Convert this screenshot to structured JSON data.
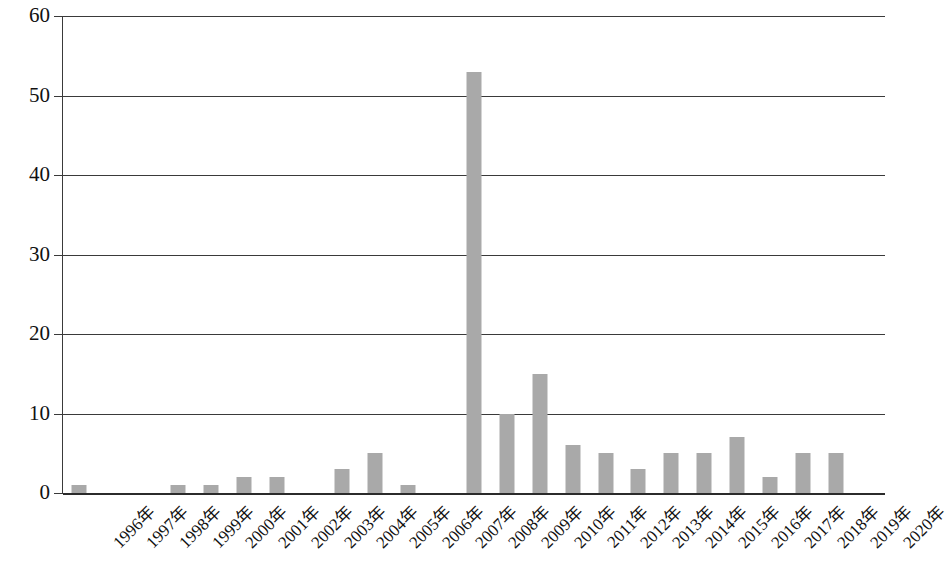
{
  "chart_data": {
    "type": "bar",
    "title": "",
    "subtitle": "",
    "xlabel": "",
    "ylabel": "",
    "ylim": [
      0,
      60
    ],
    "ytick_step": 10,
    "yticks": [
      "0",
      "10",
      "20",
      "30",
      "40",
      "50",
      "60"
    ],
    "grid": "horizontal",
    "legend": "none",
    "bar_color": "#a9a9a9",
    "axis_color": "#3a3a3a",
    "categories": [
      "1996年",
      "1997年",
      "1998年",
      "1999年",
      "2000年",
      "2001年",
      "2002年",
      "2003年",
      "2004年",
      "2005年",
      "2006年",
      "2007年",
      "2008年",
      "2009年",
      "2010年",
      "2011年",
      "2012年",
      "2013年",
      "2014年",
      "2015年",
      "2016年",
      "2017年",
      "2018年",
      "2019年",
      "2020年"
    ],
    "values": [
      1,
      0,
      0,
      1,
      1,
      2,
      2,
      0,
      3,
      5,
      1,
      0,
      53,
      10,
      15,
      6,
      5,
      3,
      5,
      5,
      7,
      2,
      5,
      5,
      0
    ]
  }
}
